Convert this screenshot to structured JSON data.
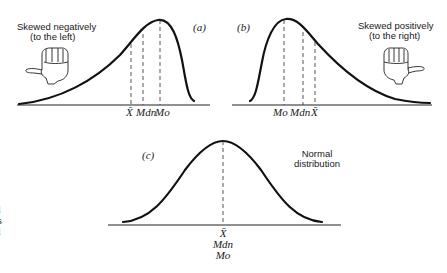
{
  "figure": {
    "panels": [
      {
        "id": "a",
        "panel_label": "(a)",
        "caption_line1": "Skewed negatively",
        "caption_line2": "(to the left)",
        "markers": [
          {
            "label": "X̄",
            "name": "mean"
          },
          {
            "label": "Mdn",
            "name": "median"
          },
          {
            "label": "Mo",
            "name": "mode"
          }
        ]
      },
      {
        "id": "b",
        "panel_label": "(b)",
        "caption_line1": "Skewed positively",
        "caption_line2": "(to the right)",
        "markers": [
          {
            "label": "Mo",
            "name": "mode"
          },
          {
            "label": "Mdn",
            "name": "median"
          },
          {
            "label": "X̄",
            "name": "mean"
          }
        ]
      },
      {
        "id": "c",
        "panel_label": "(c)",
        "caption_line1": "Normal",
        "caption_line2": "distribution",
        "markers": [
          {
            "label": "X̄",
            "name": "mean"
          },
          {
            "label": "Mdn",
            "name": "median"
          },
          {
            "label": "Mo",
            "name": "mode"
          }
        ]
      }
    ],
    "margin_fragments": [
      "l",
      "s",
      "l"
    ]
  }
}
